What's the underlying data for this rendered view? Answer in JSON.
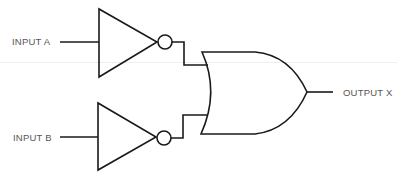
{
  "diagram": {
    "type": "logic-circuit",
    "inputs": [
      {
        "label": "INPUT A"
      },
      {
        "label": "INPUT B"
      }
    ],
    "output": {
      "label": "OUTPUT X"
    },
    "gates": [
      {
        "kind": "NOT",
        "input": "INPUT A"
      },
      {
        "kind": "NOT",
        "input": "INPUT B"
      },
      {
        "kind": "OR",
        "inputs": [
          "NOT A",
          "NOT B"
        ],
        "output": "OUTPUT X"
      }
    ],
    "colors": {
      "stroke": "#1a1a1a",
      "text": "#555555",
      "background": "#ffffff"
    }
  }
}
